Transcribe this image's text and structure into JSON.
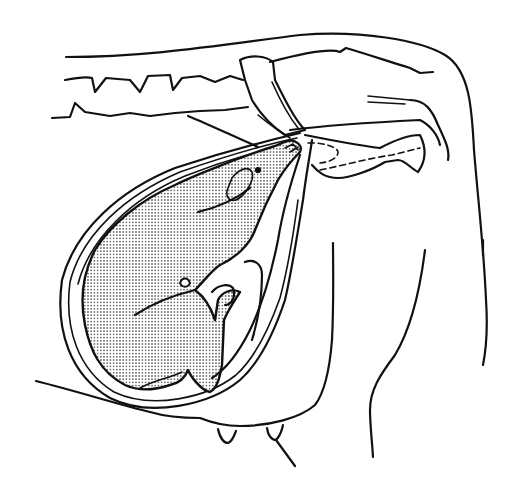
{
  "figure": {
    "width": 515,
    "height": 485,
    "colors": {
      "line": "#111111",
      "background": "#ffffff",
      "stipple": "#333333"
    },
    "paths": {
      "back_outline": "M66,57 C150,57 220,45 300,35 C360,30 420,40 445,55 C470,70 472,110 474,150 C478,200 484,250 486,300 C488,330 486,350 483,365",
      "spine_top": "M65,80 C75,78 85,76 92,78 L95,92 L106,78 L130,80 L140,92 L148,76 L170,75 L173,90 L182,78 L200,76 L215,82 L230,76 L243,80",
      "spine_bottom": "M52,118 L70,117 L75,103 L85,112 L110,116 L130,113 L150,116 L175,113 L200,111 L225,110 L248,107",
      "sacrum_top": "M270,62 C300,54 330,48 340,52 L346,48 C370,55 390,62 410,68 L420,73 L433,72",
      "pelvis_wing": "M240,60 C250,55 265,55 273,62 L275,80 C285,100 295,120 305,130 L285,135 C270,125 258,110 252,100 L245,80 Z",
      "ilium_shaft": "M272,82 C280,100 290,118 298,128 M258,115 C270,125 280,132 290,138",
      "ischium": "M290,130 C330,125 380,122 420,120 C430,125 438,135 440,145",
      "pubis": "M305,135 C330,140 355,145 380,148 C395,140 410,135 420,135 C425,145 428,158 418,172 C410,168 405,160 398,160 L385,162 C372,170 350,178 338,178 C325,178 318,172 312,165",
      "tail_lines": "M368,96 L410,100 M368,102 L405,104",
      "ischial_arc": "M410,100 C425,100 432,110 438,125 C445,140 450,150 448,160",
      "dashed_1": "M308,143 C325,142 338,148 338,152 C338,158 330,162 320,163",
      "dashed_2": "M320,170 C345,165 370,158 392,155 L420,148",
      "rectum": "M188,116 C210,125 235,137 258,147",
      "uterus_outer": "M300,133 C270,140 230,150 175,168 C120,190 75,230 62,280 C55,330 70,375 110,398 C150,418 210,405 240,380 C260,362 275,330 285,300 C292,270 298,230 303,200 C306,175 310,155 312,140",
      "uterus_inner": "M297,138 C268,144 232,154 180,172 C126,195 82,234 70,282 C64,328 78,370 114,392 C152,410 207,398 236,375 C256,357 270,326 280,298 C288,268 294,230 298,200",
      "uterus_wall3": "M295,143 C265,150 230,158 185,176 C132,198 90,238 78,284",
      "fetus_body": "M296,142 C290,138 283,143 275,146 C262,150 248,155 235,160 C215,168 195,175 175,185 C140,200 110,225 95,250 C82,275 80,300 85,325 C90,350 100,372 125,385 C140,392 155,390 170,385 C180,383 185,378 188,370 C190,375 200,390 210,392 C218,388 220,375 222,365 L224,320 C228,310 235,300 240,292 C232,288 222,292 218,300 L215,320 C210,305 202,295 195,290 C205,280 212,270 220,265 C235,258 250,245 255,230 C262,212 270,195 278,180 C285,168 292,160 300,152 C302,148 300,144 296,142 Z",
      "fetus_foreleg_line": "M135,315 C150,305 170,296 195,290",
      "fetus_ear": "M232,178 C238,170 248,165 252,172 C255,180 245,196 236,200 C228,202 225,195 228,188 Z",
      "fetus_eye": "M258,170 m-2,0 a2,2 0 1,0 4,0 a2,2 0 1,0 -4,0",
      "fetus_mouth": "M198,212 C215,208 235,200 250,188",
      "fetus_hoof_1": "M285,148 L293,144 L298,150 M290,152 L298,147",
      "fetus_knee": "M180,283 C182,277 188,277 190,283 C188,288 182,288 180,283 Z",
      "fetus_hindleg": "M212,292 C218,285 228,283 233,288 C236,296 232,305 225,305",
      "fetus_belly_line": "M140,388 C155,380 170,378 182,372",
      "abdomen_outer": "M300,155 C290,185 282,215 278,240 C272,270 262,305 250,330 C240,350 228,368 212,378",
      "abdomen_fold": "M245,262 C255,258 262,265 262,275 C262,295 258,320 252,340",
      "belly_line": "M36,381 C80,392 120,405 150,412 C170,418 190,418 200,418 C210,422 222,426 240,426 C270,426 300,418 315,405 C325,392 330,365 332,340 C334,300 333,260 333,243",
      "udder_teat_1": "M218,429 C220,438 224,443 228,443 C233,441 235,433 236,431",
      "udder_teat_2": "M267,428 C268,436 272,440 276,440 C280,436 282,430 283,425",
      "teat_line": "M276,440 L295,466",
      "hind_leg": "M425,250 C420,290 410,330 395,355 C380,375 370,390 370,410 C370,425 372,440 373,457",
      "hind_leg_right": "M483,240 L483,255"
    }
  }
}
